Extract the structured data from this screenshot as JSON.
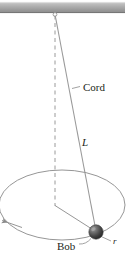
{
  "figure": {
    "canvas": {
      "width": 129,
      "height": 257
    },
    "labels": {
      "cord": "Cord",
      "length": "L",
      "bob": "Bob",
      "radius": "r"
    },
    "colors": {
      "ceiling_light": "#c9c9c9",
      "ceiling_mid": "#a8a8a8",
      "ceiling_dark": "#8d8d8d",
      "line": "#808080",
      "text": "#231f20",
      "bob_light": "#8a8a8a",
      "bob_dark": "#2f2f2f",
      "background": "#ffffff"
    },
    "geometry": {
      "ceiling": {
        "x": 0,
        "y": 2,
        "width": 125,
        "height": 11
      },
      "pivot": {
        "x": 55,
        "y": 14
      },
      "bob": {
        "x": 96,
        "y": 232,
        "radius": 7
      },
      "path_center": {
        "x": 55,
        "y": 205
      },
      "ellipse": {
        "cx": 62,
        "cy": 205,
        "rx": 63,
        "ry": 35
      }
    }
  }
}
